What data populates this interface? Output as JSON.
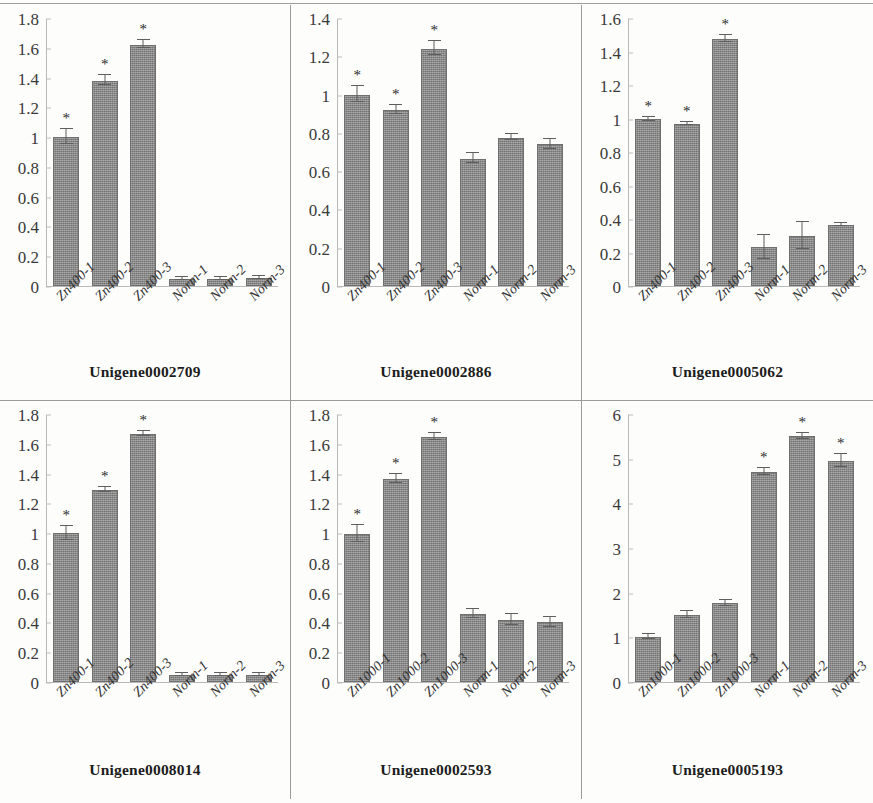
{
  "figure": {
    "panel_count": 6,
    "columns": 3,
    "rows": 2,
    "significance_marker": "*",
    "bar_color": "#8b8b8b",
    "bar_border_color": "#6f6f6f",
    "axis_color": "#b9b9b9",
    "divider_color": "#9a9a9a",
    "background": "#fdfdfc"
  },
  "chart_data": [
    {
      "type": "bar",
      "title": "Unigene0002709",
      "xlabel": "",
      "ylabel": "",
      "ylim": [
        0,
        1.8
      ],
      "yticks": [
        "0",
        "0.2",
        "0.4",
        "0.6",
        "0.8",
        "1",
        "1.2",
        "1.4",
        "1.6",
        "1.8"
      ],
      "ytick_values": [
        0,
        0.2,
        0.4,
        0.6,
        0.8,
        1,
        1.2,
        1.4,
        1.6,
        1.8
      ],
      "grid": false,
      "legend": "none",
      "categories": [
        "Zn400-1",
        "Zn400-2",
        "Zn400-3",
        "Norm-1",
        "Norm-2",
        "Norm-3"
      ],
      "values": [
        1.0,
        1.38,
        1.62,
        0.05,
        0.05,
        0.055
      ],
      "errors": [
        0.055,
        0.035,
        0.03,
        0.012,
        0.012,
        0.012
      ],
      "significance": [
        "*",
        "*",
        "*",
        "",
        "",
        ""
      ]
    },
    {
      "type": "bar",
      "title": "Unigene0002886",
      "xlabel": "",
      "ylabel": "",
      "ylim": [
        0,
        1.4
      ],
      "yticks": [
        "0",
        "0.2",
        "0.4",
        "0.6",
        "0.8",
        "1",
        "1.2",
        "1.4"
      ],
      "ytick_values": [
        0,
        0.2,
        0.4,
        0.6,
        0.8,
        1,
        1.2,
        1.4
      ],
      "grid": false,
      "legend": "none",
      "categories": [
        "Zn400-1",
        "Zn400-2",
        "Zn400-3",
        "Norm-1",
        "Norm-2",
        "Norm-3"
      ],
      "values": [
        1.0,
        0.92,
        1.24,
        0.665,
        0.775,
        0.74
      ],
      "errors": [
        0.045,
        0.025,
        0.04,
        0.03,
        0.02,
        0.03
      ],
      "significance": [
        "*",
        "*",
        "*",
        "",
        "",
        ""
      ]
    },
    {
      "type": "bar",
      "title": "Unigene0005062",
      "xlabel": "",
      "ylabel": "",
      "ylim": [
        0,
        1.6
      ],
      "yticks": [
        "0",
        "0.2",
        "0.4",
        "0.6",
        "0.8",
        "1",
        "1.2",
        "1.4",
        "1.6"
      ],
      "ytick_values": [
        0,
        0.2,
        0.4,
        0.6,
        0.8,
        1,
        1.2,
        1.4,
        1.6
      ],
      "grid": false,
      "legend": "none",
      "categories": [
        "Zn400-1",
        "Zn400-2",
        "Zn400-3",
        "Norm-1",
        "Norm-2",
        "Norm-3"
      ],
      "values": [
        0.995,
        0.965,
        1.475,
        0.23,
        0.3,
        0.363
      ],
      "errors": [
        0.015,
        0.012,
        0.022,
        0.075,
        0.085,
        0.01
      ],
      "significance": [
        "*",
        "*",
        "*",
        "",
        "",
        ""
      ]
    },
    {
      "type": "bar",
      "title": "Unigene0008014",
      "xlabel": "",
      "ylabel": "",
      "ylim": [
        0,
        1.8
      ],
      "yticks": [
        "0",
        "0.2",
        "0.4",
        "0.6",
        "0.8",
        "1",
        "1.2",
        "1.4",
        "1.6",
        "1.8"
      ],
      "ytick_values": [
        0,
        0.2,
        0.4,
        0.6,
        0.8,
        1,
        1.2,
        1.4,
        1.6,
        1.8
      ],
      "grid": false,
      "legend": "none",
      "categories": [
        "Zn400-1",
        "Zn400-2",
        "Zn400-3",
        "Norm-1",
        "Norm-2",
        "Norm-3"
      ],
      "values": [
        1.0,
        1.29,
        1.665,
        0.045,
        0.05,
        0.05
      ],
      "errors": [
        0.05,
        0.022,
        0.022,
        0.012,
        0.012,
        0.012
      ],
      "significance": [
        "*",
        "*",
        "*",
        "",
        "",
        ""
      ]
    },
    {
      "type": "bar",
      "title": "Unigene0002593",
      "xlabel": "",
      "ylabel": "",
      "ylim": [
        0,
        1.8
      ],
      "yticks": [
        "0",
        "0.2",
        "0.4",
        "0.6",
        "0.8",
        "1",
        "1.2",
        "1.4",
        "1.6",
        "1.8"
      ],
      "ytick_values": [
        0,
        0.2,
        0.4,
        0.6,
        0.8,
        1,
        1.2,
        1.4,
        1.6,
        1.8
      ],
      "grid": false,
      "legend": "none",
      "categories": [
        "Zn1000-1",
        "Zn1000-2",
        "Zn1000-3",
        "Norm-1",
        "Norm-2",
        "Norm-3"
      ],
      "values": [
        0.995,
        1.365,
        1.645,
        0.455,
        0.415,
        0.4
      ],
      "errors": [
        0.06,
        0.035,
        0.025,
        0.035,
        0.04,
        0.04
      ],
      "significance": [
        "*",
        "*",
        "*",
        "",
        "",
        ""
      ]
    },
    {
      "type": "bar",
      "title": "Unigene0005193",
      "xlabel": "",
      "ylabel": "",
      "ylim": [
        0,
        6
      ],
      "yticks": [
        "0",
        "1",
        "2",
        "3",
        "4",
        "5",
        "6"
      ],
      "ytick_values": [
        0,
        1,
        2,
        3,
        4,
        5,
        6
      ],
      "grid": false,
      "legend": "none",
      "categories": [
        "Zn1000-1",
        "Zn1000-2",
        "Zn1000-3",
        "Norm-1",
        "Norm-2",
        "Norm-3"
      ],
      "values": [
        1.0,
        1.5,
        1.76,
        4.7,
        5.5,
        4.95
      ],
      "errors": [
        0.07,
        0.09,
        0.07,
        0.09,
        0.08,
        0.15
      ],
      "significance": [
        "",
        "",
        "",
        "*",
        "*",
        "*"
      ]
    }
  ]
}
